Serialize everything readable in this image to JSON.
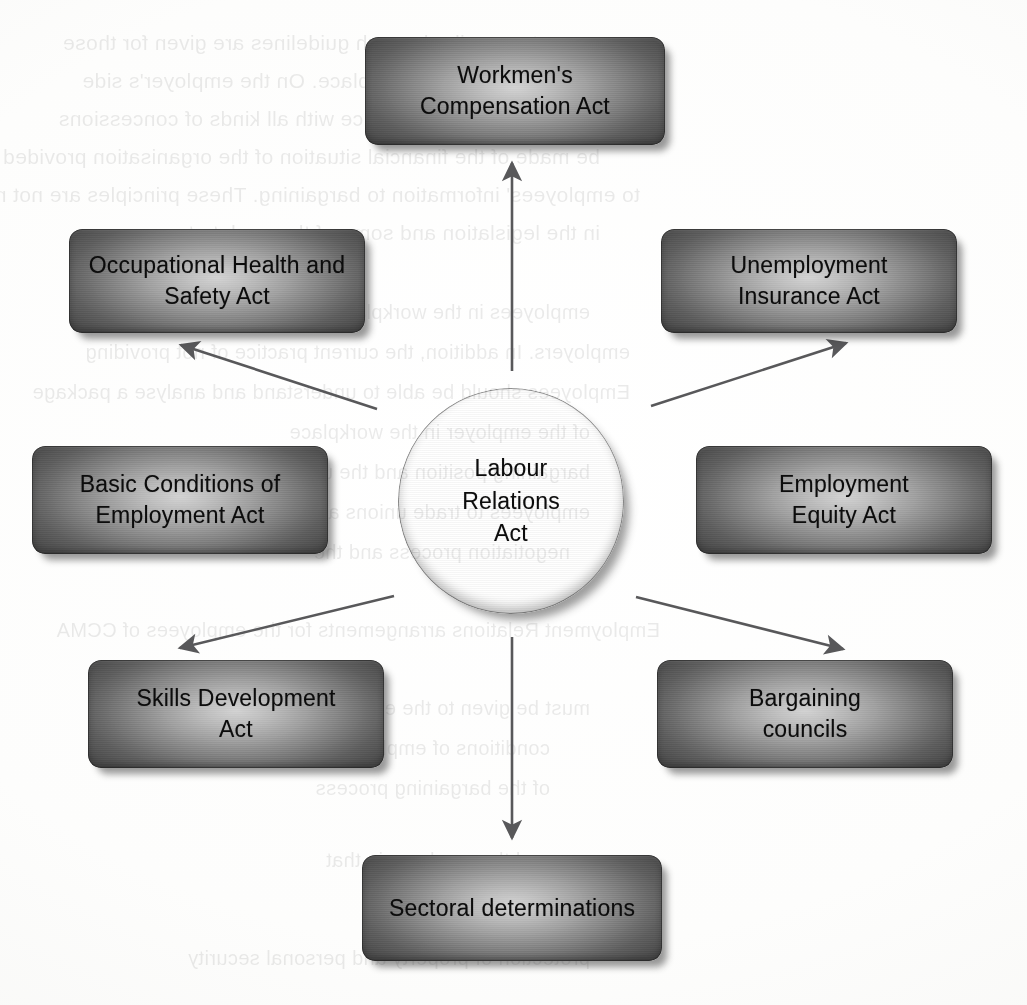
{
  "diagram": {
    "hub": {
      "id": "labour-relations-act",
      "label": "Labour\nRelations\nAct",
      "lines": [
        "Labour",
        "Relations",
        "Act"
      ]
    },
    "nodes": [
      {
        "id": "workmens-compensation-act",
        "label": "Workmen's\nCompensation Act",
        "lines": [
          "Workmen's",
          "Compensation Act"
        ],
        "position": "top",
        "x": 365,
        "y": 37,
        "width": 300,
        "height": 108
      },
      {
        "id": "occupational-health-and-safety-act",
        "label": "Occupational Health and\nSafety Act",
        "lines": [
          "Occupational Health and",
          "Safety Act"
        ],
        "position": "top-left",
        "x": 69,
        "y": 229,
        "width": 296,
        "height": 104
      },
      {
        "id": "unemployment-insurance-act",
        "label": "Unemployment\nInsurance Act",
        "lines": [
          "Unemployment",
          "Insurance Act"
        ],
        "position": "top-right",
        "x": 661,
        "y": 229,
        "width": 296,
        "height": 104
      },
      {
        "id": "basic-conditions-of-employment-act",
        "label": "Basic Conditions of\nEmployment Act",
        "lines": [
          "Basic Conditions of",
          "Employment Act"
        ],
        "position": "left",
        "x": 32,
        "y": 446,
        "width": 296,
        "height": 108
      },
      {
        "id": "employment-equity-act",
        "label": "Employment\nEquity Act",
        "lines": [
          "Employment",
          "Equity Act"
        ],
        "position": "right",
        "x": 696,
        "y": 446,
        "width": 296,
        "height": 108
      },
      {
        "id": "skills-development-act",
        "label": "Skills Development\nAct",
        "lines": [
          "Skills Development",
          "Act"
        ],
        "position": "bottom-left",
        "x": 88,
        "y": 660,
        "width": 296,
        "height": 108
      },
      {
        "id": "bargaining-councils",
        "label": "Bargaining\ncouncils",
        "lines": [
          "Bargaining",
          "councils"
        ],
        "position": "bottom-right",
        "x": 657,
        "y": 660,
        "width": 296,
        "height": 108
      },
      {
        "id": "sectoral-determinations",
        "label": "Sectoral determinations",
        "lines": [
          "Sectoral determinations"
        ],
        "position": "bottom",
        "x": 362,
        "y": 855,
        "width": 300,
        "height": 106
      }
    ],
    "arrows": [
      {
        "id": "arrow-to-workmens-compensation-act",
        "from": "labour-relations-act",
        "to": "workmens-compensation-act",
        "x1": 512,
        "y1": 371,
        "x2": 512,
        "y2": 163
      },
      {
        "id": "arrow-to-occupational-health-and-safety-act",
        "from": "labour-relations-act",
        "to": "occupational-health-and-safety-act",
        "x1": 377,
        "y1": 409,
        "x2": 179,
        "y2": 344
      },
      {
        "id": "arrow-to-unemployment-insurance-act",
        "from": "labour-relations-act",
        "to": "unemployment-insurance-act",
        "x1": 651,
        "y1": 406,
        "x2": 848,
        "y2": 342
      },
      {
        "id": "arrow-to-skills-development-act",
        "from": "labour-relations-act",
        "to": "skills-development-act",
        "x1": 394,
        "y1": 596,
        "x2": 178,
        "y2": 649
      },
      {
        "id": "arrow-to-bargaining-councils",
        "from": "labour-relations-act",
        "to": "bargaining-councils",
        "x1": 636,
        "y1": 597,
        "x2": 845,
        "y2": 650
      },
      {
        "id": "arrow-to-sectoral-determinations",
        "from": "labour-relations-act",
        "to": "sectoral-determinations",
        "x1": 512,
        "y1": 637,
        "x2": 512,
        "y2": 838
      }
    ],
    "colors": {
      "page_background": "#fbfbfa",
      "plate_center": "#d2d2d2",
      "plate_edge": "#4c4c4c",
      "text": "#0c0c0c",
      "arrow": "#58585a"
    }
  },
  "background_showthrough": {
    "description": "faint mirrored text bleeding through from the reverse side of the scanned page",
    "lines": [
      "are not prescribed, rough guidelines are given for those",
      "negotiations in the workplace. On the employer's side",
      "allowances and assistance with all kinds of concessions",
      "be made of the financial situation of the organisation provided",
      "to employees' information to bargaining. These principles are not new",
      "in the legislation and some of them relate to",
      "employees in the workplace",
      "employers. In addition, the current practice of not providing",
      "Employees should be able to understand and analyse a package",
      "of the employer in the workplace",
      "bargaining position and the union.",
      "employees to trade unions and the",
      "negotiation process and the",
      "Employment Relations arrangements for the employees of CCMA",
      "must be given to the employees",
      "conditions of employment",
      "of the bargaining process",
      "and the employer in that",
      "protection of property and personal security"
    ]
  }
}
